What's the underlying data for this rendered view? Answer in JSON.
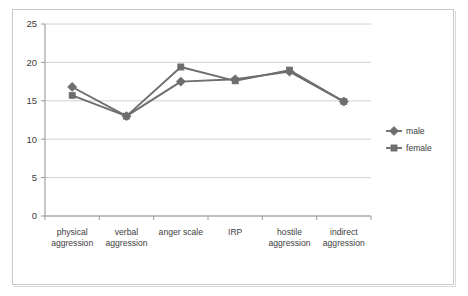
{
  "chart_data": {
    "type": "line",
    "title": "",
    "subtitle": "",
    "xlabel": "",
    "ylabel": "",
    "ylim": [
      0,
      25
    ],
    "yticks": [
      0,
      5,
      10,
      15,
      20,
      25
    ],
    "ytick_labels": [
      "0",
      "5",
      "10",
      "15",
      "20",
      "25"
    ],
    "grid": "horizontal",
    "legend_position": "right",
    "categories": [
      "physical aggression",
      "verbal aggression",
      "anger scale",
      "IRP",
      "hostile aggression",
      "indirect aggression"
    ],
    "category_lines": [
      [
        "physical",
        "aggression"
      ],
      [
        "verbal",
        "aggression"
      ],
      [
        "anger scale"
      ],
      [
        "IRP"
      ],
      [
        "hostile",
        "aggression"
      ],
      [
        "indirect",
        "aggression"
      ]
    ],
    "series": [
      {
        "name": "male",
        "marker": "diamond",
        "color": "#6e6e6e",
        "values": [
          16.8,
          13.0,
          17.5,
          17.8,
          18.8,
          14.9
        ]
      },
      {
        "name": "female",
        "marker": "square",
        "color": "#6e6e6e",
        "values": [
          15.7,
          13.0,
          19.4,
          17.6,
          19.0,
          14.9
        ]
      }
    ]
  },
  "legend": {
    "entries": [
      {
        "label": "male",
        "marker": "diamond"
      },
      {
        "label": "female",
        "marker": "square"
      }
    ]
  },
  "colors": {
    "series": "#6e6e6e",
    "gridline": "#d2d2d2",
    "axis": "#9a9a9a",
    "text": "#3d3d3d",
    "frame": "#c9c9c9",
    "background": "#ffffff"
  }
}
